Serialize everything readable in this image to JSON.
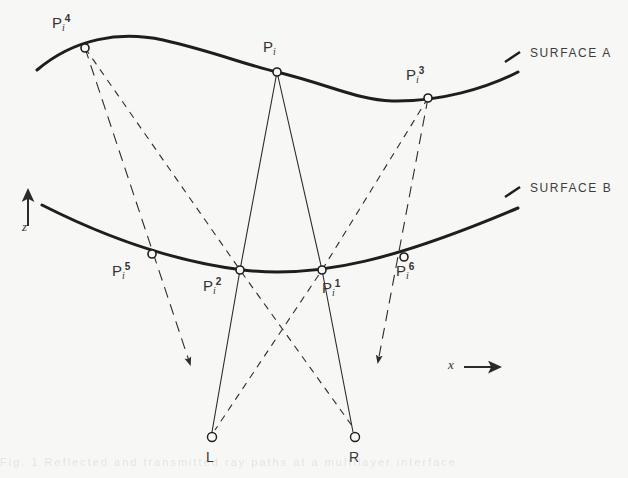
{
  "figure": {
    "background_color": "#f7f7f5",
    "ink_color": "#2b2b2b",
    "title": ""
  },
  "surfaces": [
    {
      "id": "A",
      "label": "SURFACE  A",
      "label_x": 530,
      "label_y": 53
    },
    {
      "id": "B",
      "label": "SURFACE  B",
      "label_x": 530,
      "label_y": 188
    }
  ],
  "axes": {
    "z": {
      "label": "z",
      "label_x": 22,
      "label_y": 222,
      "arrow_from_y": 226,
      "arrow_to_y": 186,
      "arrow_x": 28
    },
    "x": {
      "label": "x",
      "label_x": 448,
      "label_y": 360,
      "arrow_from_x": 464,
      "arrow_to_x": 504,
      "arrow_y": 367
    }
  },
  "points": [
    {
      "name": "P_i_4",
      "base": "P",
      "sub": "i",
      "sup": "4",
      "x": 85,
      "y": 48,
      "label_x": 52,
      "label_y": 14
    },
    {
      "name": "P_i",
      "base": "P",
      "sub": "i",
      "sup": "",
      "x": 277,
      "y": 72,
      "label_x": 263,
      "label_y": 38
    },
    {
      "name": "P_i_3",
      "base": "P",
      "sub": "i",
      "sup": "3",
      "x": 428,
      "y": 98,
      "label_x": 406,
      "label_y": 66
    },
    {
      "name": "P_i_5",
      "base": "P",
      "sub": "i",
      "sup": "5",
      "x": 152,
      "y": 254,
      "label_x": 112,
      "label_y": 262
    },
    {
      "name": "P_i_2",
      "base": "P",
      "sub": "i",
      "sup": "2",
      "x": 240,
      "y": 270,
      "label_x": 203,
      "label_y": 277
    },
    {
      "name": "P_i_1",
      "base": "P",
      "sub": "i",
      "sup": "1",
      "x": 322,
      "y": 270,
      "label_x": 322,
      "label_y": 279
    },
    {
      "name": "P_i_6",
      "base": "P",
      "sub": "i",
      "sup": "6",
      "x": 404,
      "y": 257,
      "label_x": 396,
      "label_y": 262
    },
    {
      "name": "L",
      "base": "L",
      "sub": "",
      "sup": "",
      "x": 212,
      "y": 437,
      "label_x": 206,
      "label_y": 450
    },
    {
      "name": "R",
      "base": "R",
      "sub": "",
      "sup": "",
      "x": 355,
      "y": 437,
      "label_x": 349,
      "label_y": 450
    }
  ],
  "rays": [
    {
      "name": "ray-Pi4-to-Pi5-arrow",
      "style": "long-dash",
      "arrowhead": true
    },
    {
      "name": "ray-Pi4-to-Pi2-to-R",
      "style": "dash",
      "arrowhead": false
    },
    {
      "name": "ray-Pi-to-Pi2-to-L",
      "style": "solid",
      "arrowhead": false
    },
    {
      "name": "ray-Pi-to-Pi1-to-R",
      "style": "solid",
      "arrowhead": false
    },
    {
      "name": "ray-Pi3-to-Pi1-to-L",
      "style": "dash",
      "arrowhead": false
    },
    {
      "name": "ray-Pi3-to-Pi6-arrow",
      "style": "long-dash",
      "arrowhead": true
    }
  ],
  "bleed_text": "Fig. 1  Reflected and transmitted ray paths at a multilayer interface"
}
